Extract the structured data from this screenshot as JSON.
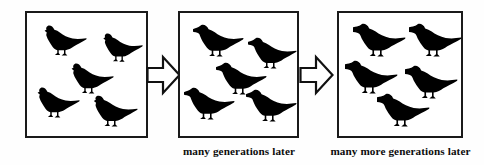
{
  "figure": {
    "background_color": "#fefefe",
    "ink_color": "#000000",
    "border_color": "#1a1a1a"
  },
  "panels": [
    {
      "id": "panel-1",
      "caption": "",
      "bird_count": 5,
      "beak_stage": "short",
      "birds": [
        {
          "x": 13,
          "y": 10,
          "w": 48,
          "h": 34,
          "beak": 4.0
        },
        {
          "x": 72,
          "y": 18,
          "w": 45,
          "h": 32,
          "beak": 4.0
        },
        {
          "x": 40,
          "y": 48,
          "w": 48,
          "h": 34,
          "beak": 4.0
        },
        {
          "x": 6,
          "y": 72,
          "w": 48,
          "h": 34,
          "beak": 4.0
        },
        {
          "x": 62,
          "y": 80,
          "w": 50,
          "h": 35,
          "beak": 4.0
        }
      ]
    },
    {
      "id": "panel-2",
      "caption": "many generations later",
      "bird_count": 5,
      "beak_stage": "medium",
      "birds": [
        {
          "x": 13,
          "y": 9,
          "w": 52,
          "h": 36,
          "beak": 9.0
        },
        {
          "x": 68,
          "y": 22,
          "w": 50,
          "h": 35,
          "beak": 9.0
        },
        {
          "x": 36,
          "y": 47,
          "w": 52,
          "h": 36,
          "beak": 9.0
        },
        {
          "x": 4,
          "y": 72,
          "w": 52,
          "h": 36,
          "beak": 9.0
        },
        {
          "x": 66,
          "y": 74,
          "w": 52,
          "h": 36,
          "beak": 9.0
        }
      ]
    },
    {
      "id": "panel-3",
      "caption": "many more generations later",
      "bird_count": 5,
      "beak_stage": "long",
      "birds": [
        {
          "x": 14,
          "y": 8,
          "w": 54,
          "h": 37,
          "beak": 15.0
        },
        {
          "x": 70,
          "y": 8,
          "w": 54,
          "h": 37,
          "beak": 15.0
        },
        {
          "x": 6,
          "y": 45,
          "w": 54,
          "h": 37,
          "beak": 15.0
        },
        {
          "x": 66,
          "y": 50,
          "w": 54,
          "h": 37,
          "beak": 15.0
        },
        {
          "x": 38,
          "y": 78,
          "w": 54,
          "h": 37,
          "beak": 15.0
        }
      ]
    }
  ],
  "arrows": [
    {
      "id": "arrow-1",
      "direction": "right"
    },
    {
      "id": "arrow-2",
      "direction": "right"
    }
  ],
  "captions": {
    "stage_2": "many generations later",
    "stage_3": "many more generations later"
  }
}
